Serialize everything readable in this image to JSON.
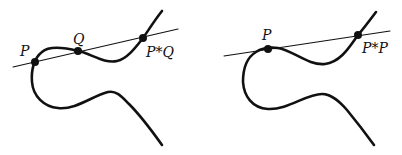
{
  "figure": {
    "colors": {
      "stroke": "#111111",
      "background": "#ffffff"
    },
    "panels": [
      {
        "name": "secant-construction",
        "line_type": "secant",
        "points": [
          {
            "id": "P",
            "label": "P"
          },
          {
            "id": "Q",
            "label": "Q"
          },
          {
            "id": "PQ",
            "label": "P*Q"
          }
        ]
      },
      {
        "name": "tangent-construction",
        "line_type": "tangent",
        "points": [
          {
            "id": "P",
            "label": "P"
          },
          {
            "id": "PP",
            "label": "P*P"
          }
        ]
      }
    ]
  }
}
